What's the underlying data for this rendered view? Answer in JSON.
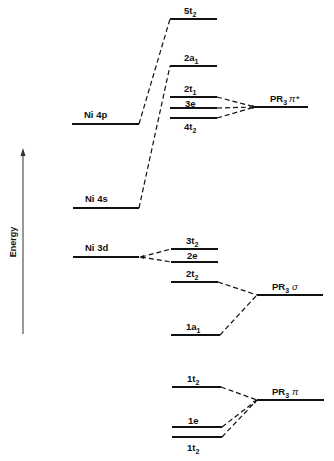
{
  "axis": {
    "label": "Energy"
  },
  "colors": {
    "ink": "#111111",
    "background": "#ffffff"
  },
  "ni_levels": {
    "ni4p": {
      "label": "Ni 4p",
      "y": 124
    },
    "ni4s": {
      "label": "Ni 4s",
      "y": 208
    },
    "ni3d": {
      "label": "Ni 3d",
      "y": 257
    }
  },
  "mo_levels": [
    {
      "id": "5t2",
      "main": "5t",
      "sub": "2",
      "y": 19
    },
    {
      "id": "2a1",
      "main": "2a",
      "sub": "1",
      "y": 66
    },
    {
      "id": "2t1",
      "main": "2t",
      "sub": "1",
      "y": 97
    },
    {
      "id": "3e",
      "main": "3e",
      "sub": "",
      "y": 108
    },
    {
      "id": "4t2",
      "main": "4t",
      "sub": "2",
      "y": 118
    },
    {
      "id": "3t2",
      "main": "3t",
      "sub": "2",
      "y": 249
    },
    {
      "id": "2e",
      "main": "2e",
      "sub": "",
      "y": 262
    },
    {
      "id": "2t2",
      "main": "2t",
      "sub": "2",
      "y": 282
    },
    {
      "id": "1a1",
      "main": "1a",
      "sub": "1",
      "y": 335
    },
    {
      "id": "1t2_upper",
      "main": "1t",
      "sub": "2",
      "y": 387
    },
    {
      "id": "1e",
      "main": "1e",
      "sub": "",
      "y": 427
    },
    {
      "id": "1t2_lower",
      "main": "1t",
      "sub": "2",
      "y": 437
    }
  ],
  "ligand_levels": {
    "pr3_pi_star": {
      "main": "PR",
      "sub": "3",
      "greek": "π*",
      "y": 107
    },
    "pr3_sigma": {
      "main": "PR",
      "sub": "3",
      "greek": "σ",
      "y": 295
    },
    "pr3_pi": {
      "main": "PR",
      "sub": "3",
      "greek": "π",
      "y": 400
    }
  }
}
